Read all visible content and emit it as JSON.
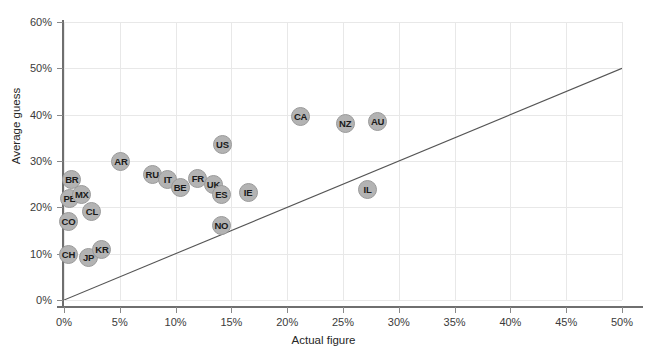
{
  "chart_data": {
    "type": "scatter",
    "title": "",
    "xlabel": "Actual figure",
    "ylabel": "Average guess",
    "xlim": [
      0,
      50
    ],
    "ylim": [
      0,
      60
    ],
    "xticks": [
      "0%",
      "5%",
      "10%",
      "15%",
      "20%",
      "25%",
      "30%",
      "35%",
      "40%",
      "45%",
      "50%"
    ],
    "yticks": [
      "0%",
      "10%",
      "20%",
      "30%",
      "40%",
      "50%",
      "60%"
    ],
    "grid": true,
    "legend": "none",
    "marker_color": "#b3b3b3",
    "reference_line": {
      "label": "y = x",
      "from": [
        0,
        0
      ],
      "to": [
        50,
        50
      ],
      "color": "#555555"
    },
    "points": [
      {
        "label": "BR",
        "x": 0.7,
        "y": 25.9
      },
      {
        "label": "PE",
        "x": 0.5,
        "y": 21.8
      },
      {
        "label": "MX",
        "x": 1.6,
        "y": 22.7
      },
      {
        "label": "CL",
        "x": 2.5,
        "y": 19.2
      },
      {
        "label": "CO",
        "x": 0.4,
        "y": 17.0
      },
      {
        "label": "CH",
        "x": 0.4,
        "y": 9.9
      },
      {
        "label": "JP",
        "x": 2.2,
        "y": 9.1
      },
      {
        "label": "KR",
        "x": 3.4,
        "y": 10.8
      },
      {
        "label": "AR",
        "x": 5.1,
        "y": 29.8
      },
      {
        "label": "RU",
        "x": 7.9,
        "y": 27.0
      },
      {
        "label": "IT",
        "x": 9.3,
        "y": 25.9
      },
      {
        "label": "BE",
        "x": 10.4,
        "y": 24.2
      },
      {
        "label": "FR",
        "x": 12.0,
        "y": 26.3
      },
      {
        "label": "UK",
        "x": 13.4,
        "y": 25.0
      },
      {
        "label": "ES",
        "x": 14.1,
        "y": 22.7
      },
      {
        "label": "US",
        "x": 14.2,
        "y": 33.5
      },
      {
        "label": "IE",
        "x": 16.5,
        "y": 23.3
      },
      {
        "label": "NO",
        "x": 14.1,
        "y": 16.0
      },
      {
        "label": "CA",
        "x": 21.2,
        "y": 39.7
      },
      {
        "label": "NZ",
        "x": 25.2,
        "y": 38.0
      },
      {
        "label": "AU",
        "x": 28.1,
        "y": 38.6
      },
      {
        "label": "IL",
        "x": 27.2,
        "y": 23.8
      }
    ]
  }
}
